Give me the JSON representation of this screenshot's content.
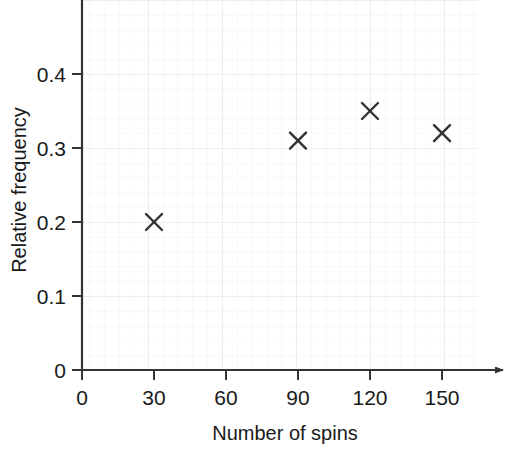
{
  "chart_data": {
    "type": "scatter",
    "title": "",
    "xlabel": "Number of spins",
    "ylabel": "Relative frequency",
    "xlim": [
      0,
      165
    ],
    "ylim": [
      0,
      0.5
    ],
    "grid": true,
    "grid_style": "graph-paper",
    "legend": "none",
    "x_ticks": [
      "0",
      "30",
      "60",
      "90",
      "120",
      "150"
    ],
    "x_tick_values": [
      0,
      30,
      60,
      90,
      120,
      150
    ],
    "y_ticks": [
      "0",
      "0.1",
      "0.2",
      "0.3",
      "0.4"
    ],
    "y_tick_values": [
      0,
      0.1,
      0.2,
      0.3,
      0.4
    ],
    "marker": "x",
    "marker_color": "#333333",
    "x": [
      30,
      90,
      120,
      150
    ],
    "values": [
      0.2,
      0.31,
      0.35,
      0.32
    ],
    "points": [
      {
        "x": 30,
        "y": 0.2
      },
      {
        "x": 90,
        "y": 0.31
      },
      {
        "x": 120,
        "y": 0.35
      },
      {
        "x": 150,
        "y": 0.32
      }
    ],
    "x_axis_arrow": true,
    "y_axis_arrow": false
  },
  "axes": {
    "x_title": "Number of spins",
    "y_title": "Relative frequency",
    "x_tick_labels": [
      "0",
      "30",
      "60",
      "90",
      "120",
      "150"
    ],
    "y_tick_labels": [
      "0",
      "0.1",
      "0.2",
      "0.3",
      "0.4"
    ]
  },
  "colors": {
    "axis": "#333333",
    "marker": "#333333",
    "grid_minor": "#eceff0",
    "grid_major": "#e0e5e6",
    "background": "#ffffff",
    "text": "#1a1a1a"
  }
}
